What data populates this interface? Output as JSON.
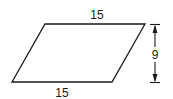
{
  "figure": {
    "shape": "parallelogram",
    "labels": {
      "top_side": "15",
      "bottom_side": "15",
      "height": "9"
    },
    "colors": {
      "stroke": "#1a1a1a",
      "background": "#ffffff"
    }
  }
}
